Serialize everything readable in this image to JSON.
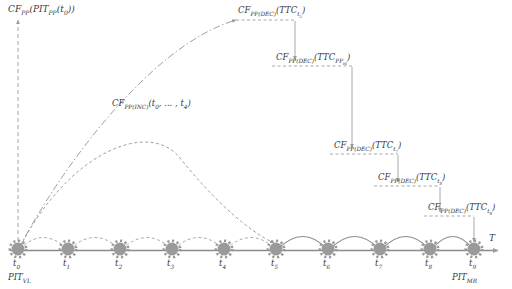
{
  "figure": {
    "type": "timeline-diagram",
    "axis_label": "T",
    "background": "#ffffff",
    "line_color": "#8c8c8c",
    "text_color": "#3a3a3a",
    "marker_color": "#9a9a9a"
  },
  "axis": {
    "label": "T",
    "start_label": "PIT",
    "start_sub": "VL",
    "end_label": "PIT",
    "end_sub": "MR"
  },
  "timepoints": [
    {
      "id": "t0",
      "base": "t",
      "sub": "0",
      "x": 18
    },
    {
      "id": "t1",
      "base": "t",
      "sub": "1",
      "x": 68
    },
    {
      "id": "t2",
      "base": "t",
      "sub": "2",
      "x": 120
    },
    {
      "id": "t3",
      "base": "t",
      "sub": "3",
      "x": 172
    },
    {
      "id": "t4",
      "base": "t",
      "sub": "4",
      "x": 224
    },
    {
      "id": "t5",
      "base": "t",
      "sub": "5",
      "x": 276
    },
    {
      "id": "t6",
      "base": "t",
      "sub": "6",
      "x": 328
    },
    {
      "id": "t7",
      "base": "t",
      "sub": "7",
      "x": 380
    },
    {
      "id": "t8",
      "base": "t",
      "sub": "8",
      "x": 430
    },
    {
      "id": "t9",
      "base": "t",
      "sub": "9",
      "x": 474
    }
  ],
  "labels": {
    "initial_cf": {
      "main": "CF",
      "main_sub": "PP",
      "arg_open": "(PIT",
      "arg_sub": "PP",
      "arg_time": "(t",
      "arg_time_sub": "0",
      "arg_close": "))",
      "full": "CF_PP(PIT_PP(t_0))"
    },
    "increase_curve": {
      "main": "CF",
      "main_sub": "PP(INC)",
      "arg": "(t",
      "arg_sub": "0",
      "arg_mid": ", ... , t",
      "arg_sub2": "4",
      "arg_close": ")",
      "full": "CF_PP(INC)(t_0, ... , t_4)"
    },
    "decrements": [
      {
        "main": "CF",
        "main_sub": "PP(DEC)",
        "arg": "(TTC",
        "arg_sub": "t5",
        "arg_sub_base": "t",
        "arg_sub_idx": "5",
        "arg_close": ")",
        "full": "CF_PP(DEC)(TTC_t5)"
      },
      {
        "main": "CF",
        "main_sub": "PP(DEC)",
        "arg": "(TTC",
        "arg_sub": "PP(t6)",
        "arg_sub_base": "PP",
        "arg_sub_idx": "t6",
        "arg_close": ")",
        "full": "CF_PP(DEC)(TTC_PP(t6))"
      },
      {
        "main": "CF",
        "main_sub": "PP(DEC)",
        "arg": "(TTC",
        "arg_sub": "t7",
        "arg_sub_base": "t",
        "arg_sub_idx": "7",
        "arg_close": ")",
        "full": "CF_PP(DEC)(TTC_t7)"
      },
      {
        "main": "CF",
        "main_sub": "PP(DEC)",
        "arg": "(TTC",
        "arg_sub": "t8",
        "arg_sub_base": "t",
        "arg_sub_idx": "8",
        "arg_close": ")",
        "full": "CF_PP(DEC)(TTC_t8)"
      },
      {
        "main": "CF",
        "main_sub": "PP(DEC)",
        "arg": "(TTC",
        "arg_sub": "t9",
        "arg_sub_base": "t",
        "arg_sub_idx": "9",
        "arg_close": ")",
        "full": "CF_PP(DEC)(TTC_t9)"
      }
    ]
  }
}
